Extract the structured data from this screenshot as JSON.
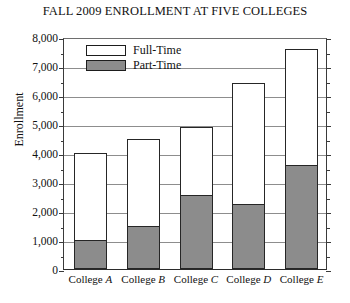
{
  "chart_data": {
    "type": "bar",
    "title": "FALL 2009 ENROLLMENT AT FIVE COLLEGES",
    "xlabel": "",
    "ylabel": "Enrollment",
    "ylim": [
      0,
      8000
    ],
    "ytick_step": 1000,
    "minor_ticks": true,
    "grid": true,
    "stacked": true,
    "legend_position": "top-left-inside",
    "categories": [
      "College A",
      "College B",
      "College C",
      "College D",
      "College E"
    ],
    "series": [
      {
        "name": "Part-Time",
        "color": "#8c8c8c",
        "values": [
          1000,
          1500,
          2550,
          2250,
          3600
        ]
      },
      {
        "name": "Full-Time",
        "color": "#ffffff",
        "values": [
          3000,
          3000,
          2350,
          4150,
          4000
        ]
      }
    ],
    "totals": [
      4000,
      4500,
      4900,
      6400,
      7600
    ],
    "ytick_labels": [
      "8,000",
      "7,000",
      "6,000",
      "5,000",
      "4,000",
      "3,000",
      "2,000",
      "1,000",
      "0"
    ],
    "ytick_values": [
      8000,
      7000,
      6000,
      5000,
      4000,
      3000,
      2000,
      1000,
      0
    ]
  },
  "legend": {
    "items": [
      {
        "label": "Full-Time",
        "swatch": "full"
      },
      {
        "label": "Part-Time",
        "swatch": "part"
      }
    ]
  },
  "axis": {
    "y_title": "Enrollment"
  }
}
